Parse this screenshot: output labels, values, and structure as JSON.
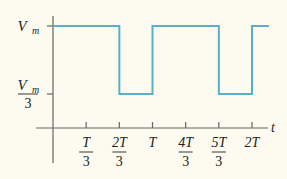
{
  "chart_data": {
    "type": "line",
    "title": "",
    "xlabel": "t",
    "ylabel": "",
    "line_color": "#5aaecb",
    "axis_color": "#555555",
    "background": "#fdfbf0",
    "period_label": "T",
    "x_range_periods": [
      0,
      2.17
    ],
    "y_levels": [
      {
        "name": "high",
        "value": 1.0,
        "label_num": "V",
        "label_sub": "m",
        "label_den": ""
      },
      {
        "name": "low",
        "value": 0.3333,
        "label_num": "V",
        "label_sub": "m",
        "label_den": "3"
      }
    ],
    "x_ticks": [
      {
        "value": 0.3333,
        "num": "T",
        "den": "3"
      },
      {
        "value": 0.6667,
        "num": "2T",
        "den": "3"
      },
      {
        "value": 1.0,
        "num": "T",
        "den": ""
      },
      {
        "value": 1.3333,
        "num": "4T",
        "den": "3"
      },
      {
        "value": 1.6667,
        "num": "5T",
        "den": "3"
      },
      {
        "value": 2.0,
        "num": "2T",
        "den": ""
      }
    ],
    "series": [
      {
        "name": "v(t)",
        "points": [
          [
            0,
            1.0
          ],
          [
            0.6667,
            1.0
          ],
          [
            0.6667,
            0.3333
          ],
          [
            1.0,
            0.3333
          ],
          [
            1.0,
            1.0
          ],
          [
            1.6667,
            1.0
          ],
          [
            1.6667,
            0.3333
          ],
          [
            2.0,
            0.3333
          ],
          [
            2.0,
            1.0
          ],
          [
            2.17,
            1.0
          ]
        ]
      }
    ],
    "grid": false,
    "legend": "none"
  }
}
